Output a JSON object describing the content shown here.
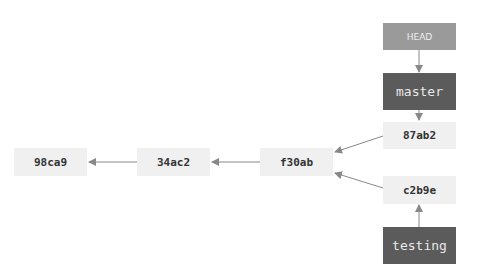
{
  "diagram": {
    "commits": [
      {
        "id": "98ca9"
      },
      {
        "id": "34ac2"
      },
      {
        "id": "f30ab"
      },
      {
        "id": "87ab2"
      },
      {
        "id": "c2b9e"
      }
    ],
    "head": {
      "label": "HEAD"
    },
    "branches": [
      {
        "name": "master"
      },
      {
        "name": "testing"
      }
    ],
    "edges": [
      {
        "from": "34ac2",
        "to": "98ca9"
      },
      {
        "from": "f30ab",
        "to": "34ac2"
      },
      {
        "from": "87ab2",
        "to": "f30ab"
      },
      {
        "from": "c2b9e",
        "to": "f30ab"
      },
      {
        "from": "HEAD",
        "to": "master"
      },
      {
        "from": "master",
        "to": "87ab2"
      },
      {
        "from": "testing",
        "to": "c2b9e"
      }
    ],
    "colors": {
      "commit_bg": "#f0f0f0",
      "head_bg": "#9a9a9a",
      "branch_bg": "#5b5b5b",
      "arrow": "#888888"
    }
  }
}
